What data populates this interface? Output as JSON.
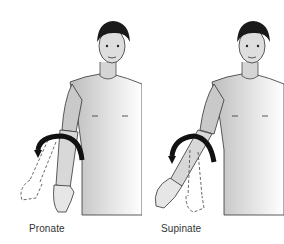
{
  "figures": [
    {
      "id": "pronate",
      "label": "Pronate",
      "arrow_direction": "clockwise-over-forearm"
    },
    {
      "id": "supinate",
      "label": "Supinate",
      "arrow_direction": "counterclockwise-over-forearm"
    }
  ],
  "colors": {
    "line": "#222222",
    "skin_shade": "#c8c8c8",
    "hair": "#1a1a1a",
    "arrow": "#111111"
  }
}
